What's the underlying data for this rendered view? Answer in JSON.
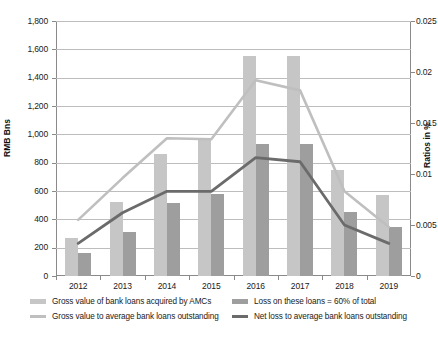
{
  "chart_data": {
    "type": "bar",
    "title": "",
    "xlabel": "",
    "ylabel": "RMB  Bns",
    "ylabel_right": "Ratios in %",
    "categories": [
      "2012",
      "2013",
      "2014",
      "2015",
      "2016",
      "2017",
      "2018",
      "2019"
    ],
    "ylim": [
      0,
      1800
    ],
    "ylim_right": [
      0,
      0.025
    ],
    "yticks": [
      "0",
      "200",
      "400",
      "600",
      "800",
      "1,000",
      "1,200",
      "1,400",
      "1,600",
      "1,800"
    ],
    "yticks_right": [
      "0",
      "0.005",
      "0.01",
      "0.015",
      "0.02",
      "0.025"
    ],
    "grid": true,
    "legend_position": "bottom",
    "series": [
      {
        "name": "Gross value of bank loans acquired by AMCs",
        "type": "bar",
        "axis": "left",
        "color": "#c6c6c6",
        "values": [
          265,
          520,
          860,
          960,
          1555,
          1555,
          745,
          575
        ]
      },
      {
        "name": "Loss on these loans = 60% of total",
        "type": "bar",
        "axis": "left",
        "color": "#9e9e9e",
        "values": [
          160,
          310,
          515,
          580,
          930,
          935,
          450,
          345
        ]
      },
      {
        "name": "Gross value to average bank loans outstanding",
        "type": "line",
        "axis": "right",
        "color": "#bfbfbf",
        "values": [
          0.0055,
          0.0096,
          0.0135,
          0.0134,
          0.0192,
          0.0182,
          0.0083,
          0.0048
        ]
      },
      {
        "name": "Net loss to average bank loans outstanding",
        "type": "line",
        "axis": "right",
        "color": "#6b6b6b",
        "values": [
          0.0032,
          0.0062,
          0.0083,
          0.0083,
          0.0116,
          0.0112,
          0.005,
          0.0032
        ]
      }
    ]
  }
}
